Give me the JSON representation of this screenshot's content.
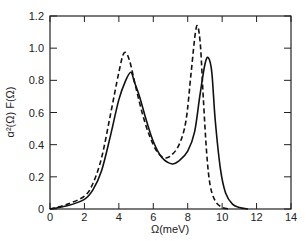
{
  "chart_data": {
    "type": "line",
    "title": "",
    "xlabel": "Ω(meV)",
    "ylabel": "α²(Ω) F(Ω)",
    "xlim": [
      0,
      14
    ],
    "ylim": [
      0,
      1.2
    ],
    "xticks": [
      "0",
      "2",
      "4",
      "6",
      "8",
      "10",
      "12",
      "14"
    ],
    "yticks": [
      "0",
      "0.2",
      "0.4",
      "0.6",
      "0.8",
      "1.0",
      "1.2"
    ],
    "grid": false,
    "legend": null,
    "series": [
      {
        "name": "solid",
        "style": "solid",
        "x": [
          0,
          1,
          2,
          2.5,
          3,
          3.5,
          4,
          4.4,
          4.7,
          4.9,
          5.2,
          5.6,
          6.0,
          6.5,
          7.1,
          7.5,
          8.0,
          8.4,
          8.7,
          9.0,
          9.2,
          9.4,
          9.6,
          9.9,
          10.2,
          10.6,
          11.0,
          11.5
        ],
        "y": [
          0,
          0.02,
          0.06,
          0.12,
          0.24,
          0.45,
          0.68,
          0.8,
          0.85,
          0.79,
          0.7,
          0.55,
          0.42,
          0.32,
          0.28,
          0.3,
          0.36,
          0.48,
          0.7,
          0.9,
          0.94,
          0.85,
          0.55,
          0.25,
          0.1,
          0.03,
          0.01,
          0
        ]
      },
      {
        "name": "dashed",
        "style": "dashed",
        "x": [
          0,
          1,
          2,
          2.5,
          3,
          3.5,
          4,
          4.3,
          4.6,
          5.0,
          5.4,
          5.8,
          6.2,
          6.6,
          7.0,
          7.5,
          7.9,
          8.2,
          8.45,
          8.6,
          8.75,
          8.9,
          9.1,
          9.3,
          9.6,
          10.0,
          10.4
        ],
        "y": [
          0,
          0.03,
          0.08,
          0.16,
          0.32,
          0.58,
          0.85,
          0.97,
          0.93,
          0.75,
          0.58,
          0.45,
          0.36,
          0.32,
          0.33,
          0.4,
          0.55,
          0.85,
          1.1,
          1.13,
          1.0,
          0.7,
          0.35,
          0.15,
          0.05,
          0.01,
          0
        ]
      }
    ]
  },
  "labels": {
    "xlabel": "Ω(meV)",
    "ylabel": "α²(Ω) F(Ω)"
  }
}
